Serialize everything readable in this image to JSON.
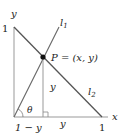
{
  "diagram": {
    "axis_labels": {
      "y": "y",
      "x": "x"
    },
    "tick_labels": {
      "y_one": "1",
      "x_one": "1"
    },
    "lines": {
      "l1": "l",
      "l1_sub": "1",
      "l2": "l",
      "l2_sub": "2"
    },
    "point_label": "P = (x, y)",
    "segment_labels": {
      "vertical": "y",
      "horizontal_right": "y",
      "horizontal_left": "1 − y"
    },
    "angle_label": "θ",
    "colors": {
      "line": "#555555",
      "axis": "#888888",
      "point": "#111111",
      "text": "#222222"
    }
  }
}
